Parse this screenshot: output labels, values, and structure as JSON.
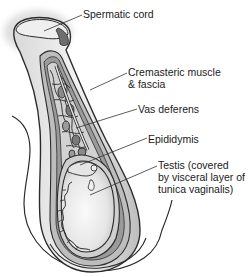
{
  "diagram": {
    "labels": [
      {
        "id": "spermatic-cord",
        "lines": [
          "Spermatic cord"
        ]
      },
      {
        "id": "cremasteric-muscle",
        "lines": [
          "Cremasteric muscle",
          "& fascia"
        ]
      },
      {
        "id": "vas-deferens",
        "lines": [
          "Vas deferens"
        ]
      },
      {
        "id": "epididymis",
        "lines": [
          "Epididymis"
        ]
      },
      {
        "id": "testis",
        "lines": [
          "Testis (covered",
          "by visceral layer of",
          "tunica vaginalis)"
        ]
      }
    ],
    "colors": {
      "outline": "#2b2b2b",
      "fill_light": "#ececec",
      "fill_mid": "#c9c9c9",
      "fill_dark": "#8a8a8a",
      "leader_line": "#333333",
      "text": "#1a1a1a"
    }
  }
}
